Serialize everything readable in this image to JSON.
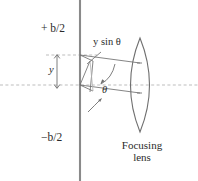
{
  "figure": {
    "type": "optics-ray-diagram",
    "title_visible": false,
    "background_color": "#ffffff",
    "stroke_color": "#6f6f6f",
    "dashed_color": "#b9b9b9",
    "text_color": "#2b2b2b",
    "labels": {
      "aperture_top": {
        "sign": "+",
        "variable": "b",
        "denominator": "2",
        "text": "+ b/2"
      },
      "aperture_bottom": {
        "sign": "−",
        "variable": "b",
        "denominator": "2",
        "text": "−b/2"
      },
      "path_difference": {
        "text": "y sin θ",
        "variable": "y",
        "function": "sin",
        "angle": "θ"
      },
      "height_offset": {
        "text": "y"
      },
      "angle": {
        "text": "θ"
      },
      "lens_caption_line1": "Focusing",
      "lens_caption_line2": "lens"
    },
    "geometry": {
      "aperture_line_x": 80,
      "aperture_line_top_y": 0,
      "aperture_line_bottom_y": 181,
      "optical_axis_y": 85,
      "upper_dashed_y": 55,
      "dimension_arrow_x": 57,
      "lens_center_x": 140,
      "lens_top_y": 38,
      "lens_bottom_y": 132
    }
  }
}
